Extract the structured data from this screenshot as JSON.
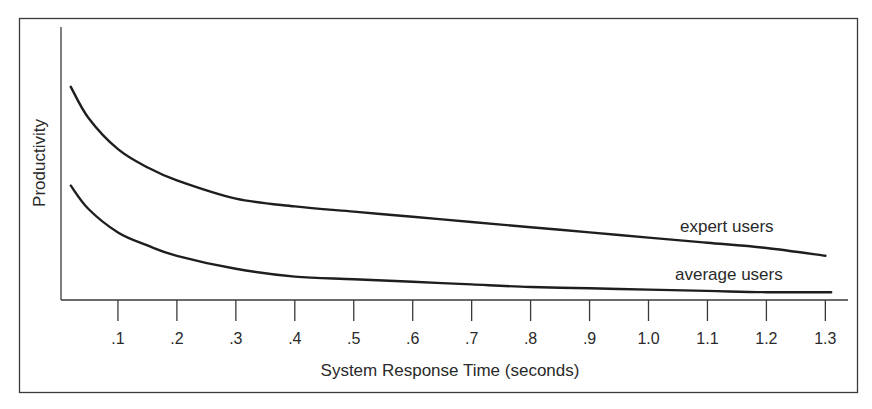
{
  "chart_data": {
    "type": "line",
    "title": "",
    "xlabel": "System Response Time (seconds)",
    "ylabel": "Productivity",
    "x_ticks": [
      ".1",
      ".2",
      ".3",
      ".4",
      ".5",
      ".6",
      ".7",
      ".8",
      ".9",
      "1.0",
      "1.1",
      "1.2",
      "1.3"
    ],
    "xlim": [
      0,
      1.35
    ],
    "y_ticks": [],
    "grid": false,
    "legend": "inline labels at right end of curves",
    "series": [
      {
        "name": "expert users",
        "x": [
          0.02,
          0.05,
          0.1,
          0.15,
          0.2,
          0.3,
          0.4,
          0.5,
          0.6,
          0.7,
          0.8,
          0.9,
          1.0,
          1.1,
          1.2,
          1.3
        ],
        "values": [
          0.82,
          0.7,
          0.58,
          0.51,
          0.46,
          0.39,
          0.36,
          0.34,
          0.32,
          0.3,
          0.28,
          0.26,
          0.24,
          0.22,
          0.2,
          0.17
        ]
      },
      {
        "name": "average users",
        "x": [
          0.02,
          0.05,
          0.1,
          0.15,
          0.2,
          0.3,
          0.4,
          0.5,
          0.6,
          0.7,
          0.8,
          0.9,
          1.0,
          1.1,
          1.2,
          1.31
        ],
        "values": [
          0.44,
          0.35,
          0.26,
          0.21,
          0.17,
          0.12,
          0.09,
          0.08,
          0.07,
          0.06,
          0.05,
          0.045,
          0.04,
          0.035,
          0.03,
          0.03
        ]
      }
    ]
  }
}
